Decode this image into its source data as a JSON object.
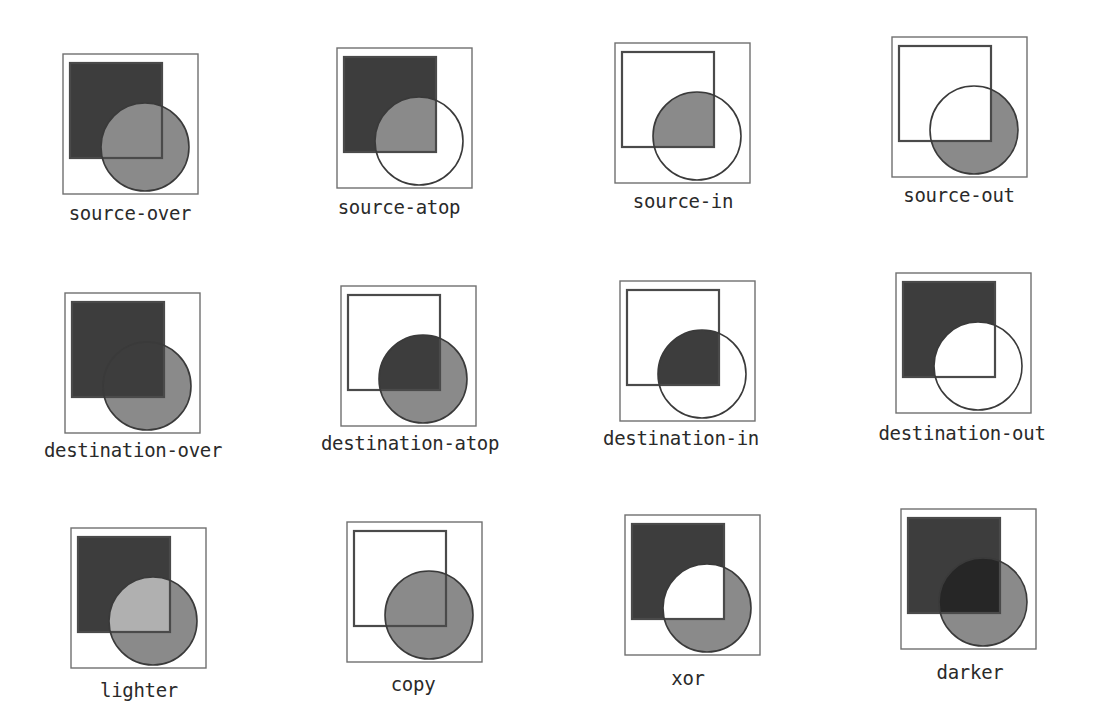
{
  "figure": {
    "colors": {
      "frame": "#707070",
      "square_fill": "#3d3d3d",
      "square_stroke": "#4a4a4a",
      "circle_fill": "#8a8a8a",
      "circle_stroke": "#3a3a3a",
      "lighter_overlap": "#b0b0b0",
      "darker_overlap": "#262626",
      "background": "#ffffff"
    },
    "panels": [
      {
        "label": "source-over",
        "mode": "source-over",
        "frame": [
          63,
          54
        ],
        "label_pos": [
          130,
          218
        ]
      },
      {
        "label": "source-atop",
        "mode": "source-atop",
        "frame": [
          337,
          48
        ],
        "label_pos": [
          399,
          212
        ]
      },
      {
        "label": "source-in",
        "mode": "source-in",
        "frame": [
          615,
          43
        ],
        "label_pos": [
          683,
          206
        ]
      },
      {
        "label": "source-out",
        "mode": "source-out",
        "frame": [
          892,
          37
        ],
        "label_pos": [
          959,
          200
        ]
      },
      {
        "label": "destination-over",
        "mode": "destination-over",
        "frame": [
          65,
          293
        ],
        "label_pos": [
          133,
          455
        ]
      },
      {
        "label": "destination-atop",
        "mode": "destination-atop",
        "frame": [
          341,
          286
        ],
        "label_pos": [
          410,
          448
        ]
      },
      {
        "label": "destination-in",
        "mode": "destination-in",
        "frame": [
          620,
          281
        ],
        "label_pos": [
          681,
          443
        ]
      },
      {
        "label": "destination-out",
        "mode": "destination-out",
        "frame": [
          896,
          273
        ],
        "label_pos": [
          962,
          438
        ]
      },
      {
        "label": "lighter",
        "mode": "lighter",
        "frame": [
          71,
          528
        ],
        "label_pos": [
          139,
          695
        ]
      },
      {
        "label": "copy",
        "mode": "copy",
        "frame": [
          347,
          522
        ],
        "label_pos": [
          413,
          689
        ]
      },
      {
        "label": "xor",
        "mode": "xor",
        "frame": [
          625,
          515
        ],
        "label_pos": [
          688,
          683
        ]
      },
      {
        "label": "darker",
        "mode": "darker",
        "frame": [
          901,
          509
        ],
        "label_pos": [
          970,
          677
        ]
      }
    ]
  }
}
